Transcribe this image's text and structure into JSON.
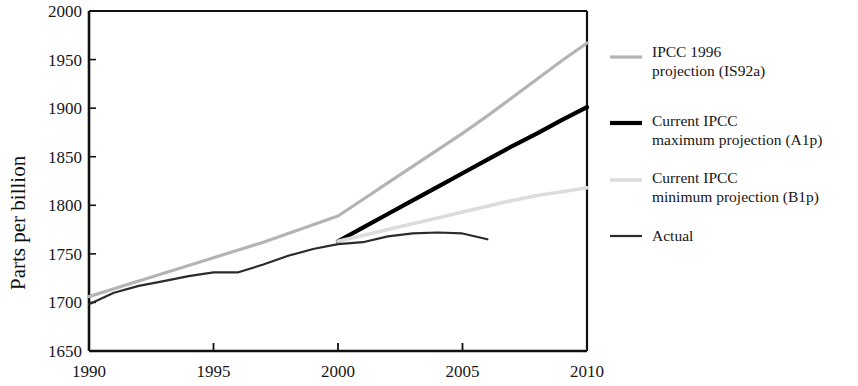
{
  "chart_data": {
    "type": "line",
    "title": "",
    "xlabel": "",
    "ylabel": "Parts per billion",
    "xlim": [
      1990,
      2010
    ],
    "ylim": [
      1650,
      2000
    ],
    "xticks": [
      1990,
      1995,
      2000,
      2005,
      2010
    ],
    "yticks": [
      1650,
      1700,
      1750,
      1800,
      1850,
      1900,
      1950,
      2000
    ],
    "xtick_labels": [
      "1990",
      "1995",
      "2000",
      "2005",
      "2010"
    ],
    "ytick_labels": [
      "1650",
      "1700",
      "1750",
      "1800",
      "1850",
      "1900",
      "1950",
      "2000"
    ],
    "grid": false,
    "legend_position": "right",
    "series": [
      {
        "name": "IPCC 1996 projection (IS92a)",
        "legend_lines": [
          "IPCC 1996",
          "projection (IS92a)"
        ],
        "color": "#b4b4b4",
        "width": 3.2,
        "x": [
          1990,
          1991,
          1992,
          1993,
          1994,
          1995,
          1996,
          1997,
          1998,
          1999,
          2000,
          2001,
          2002,
          2003,
          2004,
          2005,
          2006,
          2007,
          2008,
          2009,
          2010
        ],
        "values": [
          1706,
          1714,
          1722,
          1730,
          1738,
          1746,
          1754,
          1762,
          1771,
          1780,
          1789,
          1806,
          1823,
          1840,
          1857,
          1874,
          1892,
          1911,
          1930,
          1949,
          1967
        ]
      },
      {
        "name": "Current IPCC maximum projection (A1p)",
        "legend_lines": [
          "Current IPCC",
          "maximum projection (A1p)"
        ],
        "color": "#000000",
        "width": 4.2,
        "x": [
          2000,
          2001,
          2002,
          2003,
          2004,
          2005,
          2006,
          2007,
          2008,
          2009,
          2010
        ],
        "values": [
          1763,
          1777,
          1791,
          1805,
          1819,
          1833,
          1847,
          1861,
          1874,
          1888,
          1901
        ]
      },
      {
        "name": "Current IPCC minimum projection (B1p)",
        "legend_lines": [
          "Current IPCC",
          "minimum projection (B1p)"
        ],
        "color": "#dcdcdc",
        "width": 3.6,
        "x": [
          2000,
          2001,
          2002,
          2003,
          2004,
          2005,
          2006,
          2007,
          2008,
          2009,
          2010
        ],
        "values": [
          1763,
          1769,
          1775,
          1781,
          1787,
          1793,
          1799,
          1805,
          1810,
          1814,
          1818
        ]
      },
      {
        "name": "Actual",
        "legend_lines": [
          "Actual"
        ],
        "color": "#2b2b2b",
        "width": 2.2,
        "x": [
          1990,
          1991,
          1992,
          1993,
          1994,
          1995,
          1996,
          1997,
          1998,
          1999,
          2000,
          2001,
          2002,
          2003,
          2004,
          2005,
          2006
        ],
        "values": [
          1698,
          1710,
          1717,
          1722,
          1727,
          1731,
          1731,
          1739,
          1748,
          1755,
          1760,
          1762,
          1768,
          1771,
          1772,
          1771,
          1765
        ]
      }
    ]
  },
  "legend": {
    "entries": [
      {
        "label_line1": "IPCC 1996",
        "label_line2": "projection (IS92a)"
      },
      {
        "label_line1": "Current IPCC",
        "label_line2": "maximum projection (A1p)"
      },
      {
        "label_line1": "Current IPCC",
        "label_line2": "minimum projection (B1p)"
      },
      {
        "label_line1": "Actual",
        "label_line2": ""
      }
    ]
  },
  "axes": {
    "y_title": "Parts per billion",
    "frame_color": "#111111"
  }
}
